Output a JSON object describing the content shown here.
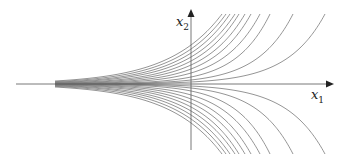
{
  "diagram": {
    "type": "phase-portrait",
    "axes": {
      "x_label": "x",
      "x_sub": "1",
      "y_label": "x",
      "y_sub": "2",
      "origin_px": [
        191,
        84
      ],
      "x_range_px": [
        16,
        332
      ],
      "y_range_px": [
        10,
        150
      ],
      "color": "#555555"
    },
    "curves": {
      "color": "#7a7a7a",
      "converge_x_px": 55,
      "top_y_px": 14,
      "axis_crossings_y_px": [
        45,
        49,
        53,
        57,
        61,
        65,
        69,
        73,
        77,
        80,
        82
      ],
      "top_x_px": [
        222,
        226,
        230,
        235,
        239,
        245,
        251,
        260,
        270,
        293,
        325
      ],
      "mirrored_below_axis": true
    }
  }
}
